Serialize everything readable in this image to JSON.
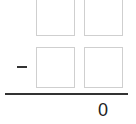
{
  "problem": {
    "type": "vertical-subtraction",
    "operator": "-",
    "operator_name": "minus",
    "top_row": [
      {
        "digit": "",
        "placeholder": "empty"
      },
      {
        "digit": "",
        "placeholder": "empty"
      }
    ],
    "bottom_row": [
      {
        "digit": "",
        "placeholder": "empty"
      },
      {
        "digit": "",
        "placeholder": "empty"
      }
    ],
    "result": "0"
  },
  "colors": {
    "box_border": "#cfcfcf",
    "line": "#333333",
    "text": "#222222"
  }
}
